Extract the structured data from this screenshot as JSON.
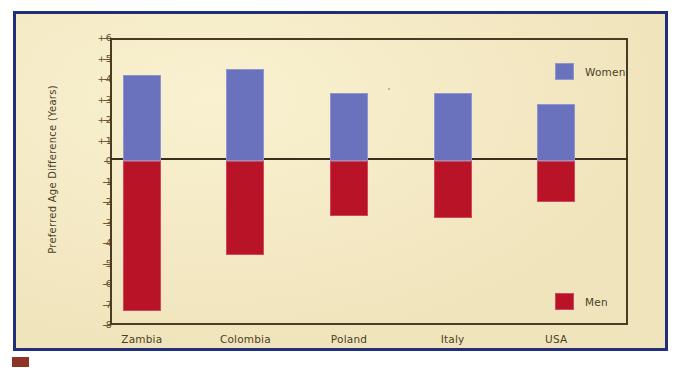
{
  "chart_data": {
    "type": "bar",
    "title": "",
    "subtitle": "",
    "xlabel": "",
    "ylabel": "Preferred Age Difference (Years)",
    "categories": [
      "Zambia",
      "Colombia",
      "Poland",
      "Italy",
      "USA"
    ],
    "series": [
      {
        "name": "Women",
        "color": "#6b72bd",
        "values": [
          4.2,
          4.5,
          3.3,
          3.3,
          2.8
        ]
      },
      {
        "name": "Men",
        "color": "#b81326",
        "values": [
          -7.3,
          -4.6,
          -2.7,
          -2.8,
          -2.0
        ]
      }
    ],
    "ylim": [
      -8,
      6
    ],
    "yticks": [
      "+6",
      "+5",
      "+4",
      "+3",
      "+2",
      "+1",
      "0",
      "-1",
      "-2",
      "-3",
      "-4",
      "-5",
      "-6",
      "-7",
      "-8"
    ],
    "ytick_values": [
      6,
      5,
      4,
      3,
      2,
      1,
      0,
      -1,
      -2,
      -3,
      -4,
      -5,
      -6,
      -7,
      -8
    ],
    "grid": false,
    "zero_line": true,
    "legend_position": "right",
    "legend": [
      {
        "label": "Women",
        "color": "#6b72bd"
      },
      {
        "label": "Men",
        "color": "#b81326"
      }
    ]
  },
  "figure": {
    "background_color": "#f2e6bd",
    "border_color": "#1f2f7a",
    "axis_color": "#4a3b22",
    "text_color": "#4b3f26"
  }
}
